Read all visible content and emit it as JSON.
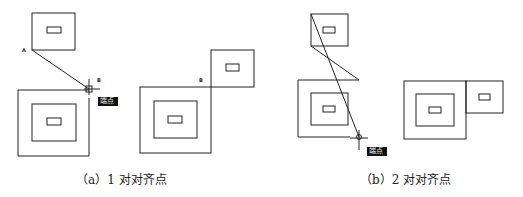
{
  "panels": [
    {
      "id": "a",
      "caption": "（a）1 对对齐点",
      "label_a": "A",
      "label_b": "B",
      "snap_tooltip": "端点",
      "result_label": "B"
    },
    {
      "id": "b",
      "caption": "（b）2 对对齐点",
      "snap_tooltip": "端点"
    }
  ]
}
